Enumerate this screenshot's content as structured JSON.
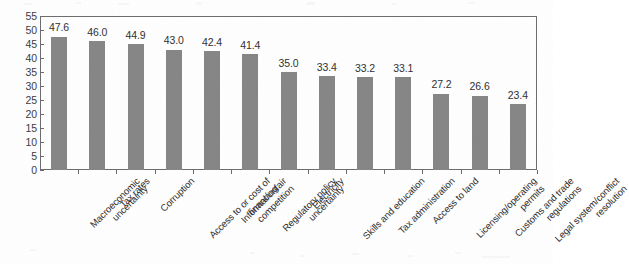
{
  "chart_data": {
    "type": "bar",
    "title": "",
    "subtitle": "",
    "xlabel": "",
    "ylabel": "",
    "ylim": [
      0,
      55
    ],
    "ytick_step": 5,
    "yticks": [
      "0",
      "5",
      "10",
      "15",
      "20",
      "25",
      "30",
      "35",
      "40",
      "45",
      "50",
      "55"
    ],
    "grid": false,
    "legend": false,
    "orientation": "vertical",
    "value_labels": true,
    "categories": [
      "Macroeconomic uncertainty",
      "Tax rates",
      "Corruption",
      "Access to or cost of financing",
      "Informal/unfair competition",
      "Regulatory policy uncertainty",
      "Electricity",
      "Skills and education",
      "Tax administration",
      "Access to land",
      "Licensing/operating permits",
      "Customs and trade regulations",
      "Legal system/conflict resolution"
    ],
    "category_lines": [
      [
        "Macroeconomic",
        "uncertainty"
      ],
      [
        "Tax rates"
      ],
      [
        "Corruption"
      ],
      [
        "Access to or cost of",
        "financing"
      ],
      [
        "Informal/unfair",
        "competition"
      ],
      [
        "Regulatory policy",
        "uncertainty"
      ],
      [
        "Electricity"
      ],
      [
        "Skills and education"
      ],
      [
        "Tax administration"
      ],
      [
        "Access to land"
      ],
      [
        "Licensing/operating",
        "permits"
      ],
      [
        "Customs and trade",
        "regulations"
      ],
      [
        "Legal system/conflict",
        "resolution"
      ]
    ],
    "values": [
      47.6,
      46.0,
      44.9,
      43.0,
      42.4,
      41.4,
      35.0,
      33.4,
      33.2,
      33.1,
      27.2,
      26.6,
      23.4
    ],
    "value_label_text": [
      "47.6",
      "46.0",
      "44.9",
      "43.0",
      "42.4",
      "41.4",
      "35.0",
      "33.4",
      "33.2",
      "33.1",
      "27.2",
      "26.6",
      "23.4"
    ],
    "colors": {
      "bar": "#858585",
      "axis": "#6b6b6b",
      "text": "#2b2b2b",
      "background": "#ffffff"
    }
  }
}
